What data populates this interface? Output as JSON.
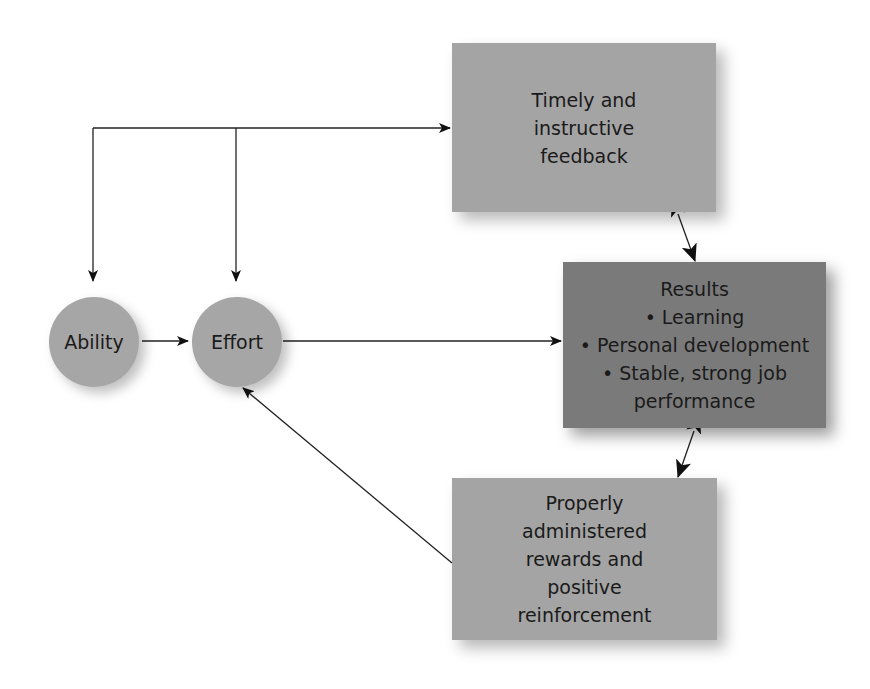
{
  "diagram": {
    "nodes": {
      "ability": {
        "label": "Ability"
      },
      "effort": {
        "label": "Effort"
      },
      "feedback": {
        "lines": [
          "Timely and",
          "instructive",
          "feedback"
        ]
      },
      "results": {
        "lines": [
          "Results",
          "• Learning",
          "• Personal development",
          "• Stable, strong job",
          "performance"
        ]
      },
      "rewards": {
        "lines": [
          "Properly",
          "administered",
          "rewards and",
          "positive",
          "reinforcement"
        ]
      }
    },
    "edges": [
      {
        "from": "ability",
        "to": "effort",
        "type": "arrow"
      },
      {
        "from": "effort",
        "to": "results",
        "type": "line-arrow"
      },
      {
        "from": "feedback-loop",
        "to": "ability",
        "type": "arrow"
      },
      {
        "from": "feedback-loop",
        "to": "effort",
        "type": "arrow"
      },
      {
        "from": "feedback-loop",
        "to": "feedback",
        "type": "arrow"
      },
      {
        "from": "feedback",
        "to": "results",
        "type": "bidirectional"
      },
      {
        "from": "results",
        "to": "rewards",
        "type": "bidirectional"
      },
      {
        "from": "rewards",
        "to": "effort",
        "type": "arrow"
      }
    ],
    "colors": {
      "light_fill": "#a4a4a4",
      "dark_fill": "#7a7a7a",
      "circle_fill": "#a6a6a6",
      "line": "#1a1a1a"
    }
  }
}
